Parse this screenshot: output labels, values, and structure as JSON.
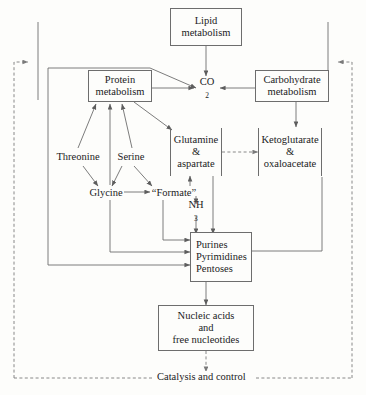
{
  "diagram": {
    "background": "#fdfdfb",
    "stroke": "#6d6d6d",
    "text_color": "#1b1b1b",
    "nodes": {
      "lipid": {
        "lines": [
          "Lipid",
          "metabolism"
        ],
        "style": "boxed"
      },
      "protein": {
        "lines": [
          "Protein",
          "metabolism"
        ],
        "style": "boxed"
      },
      "carbohydrate": {
        "lines": [
          "Carbohydrate",
          "metabolism"
        ],
        "style": "boxed"
      },
      "co2": {
        "label": "CO",
        "subscript": "2",
        "style": "plain"
      },
      "glutamine": {
        "lines": [
          "Glutamine",
          "&",
          "aspartate"
        ],
        "style": "bracket"
      },
      "ketoglutarate": {
        "lines": [
          "Ketoglutarate",
          "&",
          "oxaloacetate"
        ],
        "style": "bracket"
      },
      "threonine": {
        "lines": [
          "Threonine"
        ],
        "style": "plain"
      },
      "serine": {
        "lines": [
          "Serine"
        ],
        "style": "plain"
      },
      "glycine": {
        "lines": [
          "Glycine"
        ],
        "style": "plain"
      },
      "formate": {
        "lines": [
          "“Formate”"
        ],
        "style": "plain"
      },
      "ammonia": {
        "label": "NH",
        "subscript": "3",
        "style": "plain"
      },
      "purines": {
        "lines": [
          "Purines",
          "Pyrimidines",
          "Pentoses"
        ],
        "style": "boxed"
      },
      "nucleic": {
        "lines": [
          "Nucleic acids",
          "and",
          "free nucleotides"
        ],
        "style": "boxed"
      }
    },
    "feedback_label": "Catalysis and control"
  }
}
